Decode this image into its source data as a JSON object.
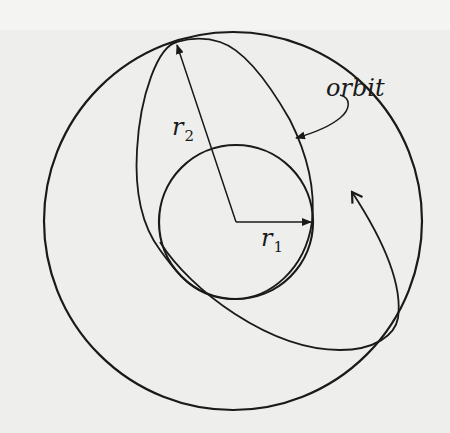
{
  "figure": {
    "labels": {
      "r1": "r",
      "r1_sub": "1",
      "r2": "r",
      "r2_sub": "2",
      "orbit": "orbit"
    },
    "elements": {
      "outer_circle": {
        "cx": 233,
        "cy": 221,
        "r": 189
      },
      "inner_circle": {
        "cx": 236,
        "cy": 222,
        "r": 77
      },
      "r1_arrow": {
        "from": [
          236,
          222
        ],
        "to": [
          311,
          222
        ]
      },
      "r2_arrow": {
        "from": [
          236,
          222
        ],
        "to": [
          177,
          44
        ]
      }
    },
    "colors": {
      "stroke": "#1a1a1a",
      "background": "#eeeeec"
    }
  }
}
